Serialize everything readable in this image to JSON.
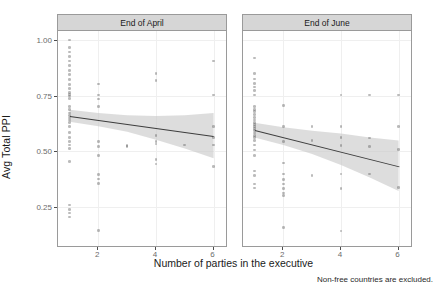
{
  "chart_data": {
    "type": "scatter",
    "title": "",
    "xlabel": "Number of parties in the executive",
    "ylabel": "Avg Total PPI",
    "caption": "Non-free countries are excluded.",
    "xlim": [
      0.6,
      6.5
    ],
    "ylim": [
      0.07,
      1.04
    ],
    "xticks": [
      2,
      4,
      6
    ],
    "xtick_labels": [
      "2",
      "4",
      "6"
    ],
    "yticks": [
      0.25,
      0.5,
      0.75,
      1.0
    ],
    "ytick_labels": [
      "0.25",
      "0.50",
      "0.75",
      "1.00"
    ],
    "grid": true,
    "legend": "none",
    "facet_labels": [
      "End of April",
      "End of June"
    ],
    "colors": {
      "point": "#555555",
      "line": "#3d3d3d",
      "ribbon": "#c8c8c8",
      "strip": "#d6d6d6",
      "panel_border": "#9a9a9a",
      "grid": "#efefef",
      "axis_text": "#6b6b6b",
      "label_text": "#1a1a1a",
      "background": "#ffffff"
    },
    "panels": [
      {
        "label": "End of April",
        "points": [
          [
            1,
            1.0
          ],
          [
            1,
            0.965
          ],
          [
            1,
            0.945
          ],
          [
            1,
            0.925
          ],
          [
            1,
            0.905
          ],
          [
            1,
            0.885
          ],
          [
            1,
            0.862
          ],
          [
            1,
            0.845
          ],
          [
            1,
            0.822
          ],
          [
            1,
            0.8
          ],
          [
            1,
            0.782
          ],
          [
            1,
            0.765
          ],
          [
            1,
            0.755
          ],
          [
            1,
            0.748
          ],
          [
            1,
            0.738
          ],
          [
            1,
            0.702
          ],
          [
            1,
            0.688
          ],
          [
            1,
            0.672
          ],
          [
            1,
            0.66
          ],
          [
            1,
            0.65
          ],
          [
            1,
            0.64
          ],
          [
            1,
            0.628
          ],
          [
            1,
            0.61
          ],
          [
            1,
            0.585
          ],
          [
            1,
            0.562
          ],
          [
            1,
            0.545
          ],
          [
            1,
            0.528
          ],
          [
            1,
            0.512
          ],
          [
            1,
            0.455
          ],
          [
            1,
            0.258
          ],
          [
            1,
            0.238
          ],
          [
            1,
            0.222
          ],
          [
            1,
            0.205
          ],
          [
            2,
            0.802
          ],
          [
            2,
            0.752
          ],
          [
            2,
            0.735
          ],
          [
            2,
            0.7
          ],
          [
            2,
            0.545
          ],
          [
            2,
            0.52
          ],
          [
            2,
            0.482
          ],
          [
            2,
            0.395
          ],
          [
            2,
            0.375
          ],
          [
            2,
            0.355
          ],
          [
            2,
            0.145
          ],
          [
            3,
            0.525
          ],
          [
            3,
            0.522
          ],
          [
            4,
            0.848
          ],
          [
            4,
            0.818
          ],
          [
            4,
            0.572
          ],
          [
            4,
            0.545
          ],
          [
            4,
            0.532
          ],
          [
            4,
            0.462
          ],
          [
            4,
            0.442
          ],
          [
            5,
            0.528
          ],
          [
            6,
            0.905
          ],
          [
            6,
            0.752
          ],
          [
            6,
            0.612
          ],
          [
            6,
            0.562
          ],
          [
            6,
            0.528
          ],
          [
            6,
            0.432
          ]
        ],
        "fit": {
          "x0": 1,
          "y0": 0.658,
          "x1": 6,
          "y1": 0.568
        },
        "ribbon": {
          "x": [
            1,
            2,
            3,
            4,
            5,
            6
          ],
          "lower": [
            0.632,
            0.612,
            0.588,
            0.552,
            0.512,
            0.468
          ],
          "upper": [
            0.686,
            0.672,
            0.662,
            0.658,
            0.662,
            0.672
          ]
        }
      },
      {
        "label": "End of June",
        "points": [
          [
            1,
            0.918
          ],
          [
            1,
            0.848
          ],
          [
            1,
            0.825
          ],
          [
            1,
            0.805
          ],
          [
            1,
            0.788
          ],
          [
            1,
            0.772
          ],
          [
            1,
            0.752
          ],
          [
            1,
            0.7
          ],
          [
            1,
            0.688
          ],
          [
            1,
            0.678
          ],
          [
            1,
            0.665
          ],
          [
            1,
            0.652
          ],
          [
            1,
            0.64
          ],
          [
            1,
            0.63
          ],
          [
            1,
            0.62
          ],
          [
            1,
            0.612
          ],
          [
            1,
            0.602
          ],
          [
            1,
            0.592
          ],
          [
            1,
            0.582
          ],
          [
            1,
            0.572
          ],
          [
            1,
            0.562
          ],
          [
            1,
            0.548
          ],
          [
            1,
            0.528
          ],
          [
            1,
            0.505
          ],
          [
            1,
            0.482
          ],
          [
            1,
            0.412
          ],
          [
            1,
            0.392
          ],
          [
            1,
            0.352
          ],
          [
            1,
            0.335
          ],
          [
            2,
            0.705
          ],
          [
            2,
            0.612
          ],
          [
            2,
            0.545
          ],
          [
            2,
            0.448
          ],
          [
            2,
            0.398
          ],
          [
            2,
            0.372
          ],
          [
            2,
            0.352
          ],
          [
            2,
            0.332
          ],
          [
            2,
            0.312
          ],
          [
            2,
            0.302
          ],
          [
            2,
            0.158
          ],
          [
            3,
            0.612
          ],
          [
            3,
            0.548
          ],
          [
            3,
            0.392
          ],
          [
            4,
            0.752
          ],
          [
            4,
            0.612
          ],
          [
            4,
            0.562
          ],
          [
            4,
            0.525
          ],
          [
            4,
            0.398
          ],
          [
            4,
            0.332
          ],
          [
            4,
            0.142
          ],
          [
            5,
            0.752
          ],
          [
            5,
            0.56
          ],
          [
            5,
            0.522
          ],
          [
            5,
            0.398
          ],
          [
            6,
            0.752
          ],
          [
            6,
            0.612
          ],
          [
            6,
            0.508
          ],
          [
            6,
            0.338
          ]
        ],
        "fit": {
          "x0": 1,
          "y0": 0.595,
          "x1": 6,
          "y1": 0.432
        },
        "ribbon": {
          "x": [
            1,
            2,
            3,
            4,
            5,
            6
          ],
          "lower": [
            0.562,
            0.528,
            0.488,
            0.438,
            0.382,
            0.322
          ],
          "upper": [
            0.628,
            0.608,
            0.592,
            0.58,
            0.562,
            0.548
          ]
        }
      }
    ]
  }
}
